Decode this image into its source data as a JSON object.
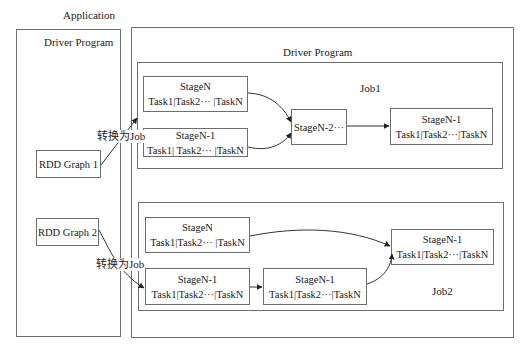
{
  "title": "Application",
  "left_driver": {
    "title": "Driver Program",
    "rdd_graphs": [
      {
        "label": "RDD Graph 1"
      },
      {
        "label": "RDD Graph 2"
      }
    ]
  },
  "right_driver": {
    "title": "Driver Program",
    "jobs": [
      {
        "label": "Job1",
        "stages": [
          {
            "name": "StageN",
            "tasks": "Task1|Task2··· |TaskN"
          },
          {
            "name": "StageN-1",
            "tasks": "Task1| Task2··· |TaskN"
          },
          {
            "name": "StageN-2···",
            "tasks": ""
          },
          {
            "name": "StageN-1",
            "tasks": "Task1|Task2···|TaskN"
          }
        ]
      },
      {
        "label": "Job2",
        "stages": [
          {
            "name": "StageN",
            "tasks": "Task1|Task2··· |TaskN"
          },
          {
            "name": "StageN-1",
            "tasks": "Task1|Task2···|TaskN"
          },
          {
            "name": "StageN-1",
            "tasks": "Task1|Task2···|TaskN"
          },
          {
            "name": "StageN-1",
            "tasks": "Task1|Task2···|TaskN"
          }
        ]
      }
    ]
  },
  "arrows": {
    "convert_label_1": "转换为Job",
    "convert_label_2": "转换为Job"
  },
  "colors": {
    "line": "#6e6e6e",
    "arrow": "#222222",
    "background": "#ffffff"
  }
}
